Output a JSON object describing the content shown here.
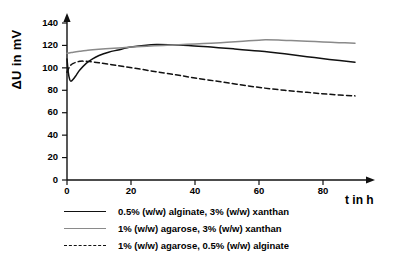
{
  "chart_data": {
    "type": "line",
    "title": "",
    "xlabel": "t in h",
    "ylabel": "ΔU in mV",
    "xlim": [
      0,
      95
    ],
    "ylim": [
      0,
      148
    ],
    "xticks": [
      0,
      20,
      40,
      60,
      80
    ],
    "yticks": [
      0,
      20,
      40,
      60,
      80,
      100,
      120,
      140
    ],
    "grid": false,
    "legend_position": "below",
    "axis_arrows": true,
    "series": [
      {
        "name": "0.5% (w/w) alginate, 3% (w/w) xanthan",
        "style": "solid",
        "color": "#111111",
        "x": [
          0,
          0.4,
          0.8,
          1.2,
          2,
          3,
          4,
          6,
          8,
          10,
          13,
          16,
          20,
          24,
          28,
          33,
          38,
          45,
          52,
          60,
          68,
          75,
          82,
          90
        ],
        "y": [
          108,
          96,
          90,
          88,
          90,
          94,
          98,
          104,
          108,
          111,
          114,
          116,
          118.5,
          120,
          120.8,
          120.5,
          120,
          118.5,
          117,
          115,
          112.5,
          110,
          107.5,
          105
        ]
      },
      {
        "name": "1% (w/w) agarose, 3% (w/w) xanthan",
        "style": "solid",
        "color": "#8a8a8a",
        "x": [
          0,
          1,
          2,
          4,
          6,
          9,
          12,
          16,
          20,
          25,
          30,
          35,
          40,
          45,
          50,
          55,
          60,
          62,
          66,
          70,
          75,
          80,
          85,
          90
        ],
        "y": [
          113,
          113.5,
          114,
          114.8,
          115.5,
          116.3,
          117,
          117.8,
          118.5,
          119.3,
          120,
          120.6,
          121.3,
          122,
          122.8,
          123.8,
          124.7,
          125,
          124.8,
          124.3,
          123.7,
          123.1,
          122.5,
          122
        ]
      },
      {
        "name": "1% (w/w) agarose, 0.5% (w/w) alginate",
        "style": "dashed",
        "color": "#111111",
        "x": [
          0,
          0.6,
          1.2,
          2,
          3,
          4,
          5,
          7,
          10,
          14,
          18,
          23,
          28,
          34,
          40,
          47,
          54,
          61,
          68,
          75,
          82,
          90
        ],
        "y": [
          96,
          100,
          102.5,
          104,
          105.2,
          105.8,
          106,
          105.6,
          104.5,
          102.8,
          101,
          98.8,
          96.5,
          93.8,
          91,
          88,
          85,
          82.2,
          80,
          78.2,
          76.4,
          75
        ]
      }
    ]
  },
  "legend": {
    "items": [
      {
        "label": "0.5% (w/w) alginate, 3% (w/w) xanthan"
      },
      {
        "label": "1% (w/w) agarose, 3% (w/w) xanthan"
      },
      {
        "label": "1% (w/w) agarose, 0.5% (w/w) alginate"
      }
    ]
  },
  "axis_labels": {
    "y": "ΔU in mV",
    "x": "t in h"
  },
  "ytick_labels": [
    "0",
    "20",
    "40",
    "60",
    "80",
    "100",
    "120",
    "140"
  ],
  "xtick_labels": [
    "0",
    "20",
    "40",
    "60",
    "80"
  ]
}
